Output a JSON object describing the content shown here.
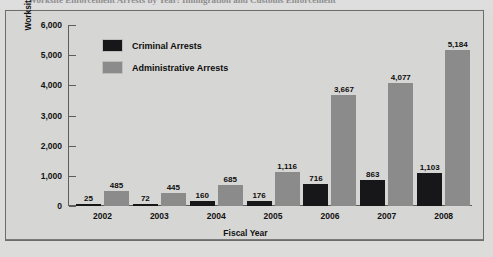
{
  "page": {
    "title_partial": "Worksite Enforcement Arrests by Year: Immigration and Customs Enforcement"
  },
  "legend": {
    "position": "inside-top-left",
    "items": [
      {
        "label": "Criminal Arrests",
        "color": "#17171a"
      },
      {
        "label": "Administrative Arrests",
        "color": "#8b8b8b"
      }
    ]
  },
  "axes": {
    "y_title": "Worksite Enforcement Arrests",
    "x_title": "Fiscal Year",
    "y_ticks": [
      "0",
      "1,000",
      "2,000",
      "3,000",
      "4,000",
      "5,000",
      "6,000"
    ]
  },
  "chart_data": {
    "type": "bar",
    "title": "Worksite Enforcement Arrests by Year: Immigration and Customs Enforcement",
    "xlabel": "Fiscal Year",
    "ylabel": "Worksite Enforcement Arrests",
    "ylim": [
      0,
      6000
    ],
    "ytick_step": 1000,
    "grid": false,
    "legend_position": "inside-top-left",
    "categories": [
      "2002",
      "2003",
      "2004",
      "2005",
      "2006",
      "2007",
      "2008"
    ],
    "series": [
      {
        "name": "Criminal Arrests",
        "color": "#17171a",
        "values": [
          25,
          72,
          160,
          176,
          716,
          863,
          1103
        ],
        "labels": [
          "25",
          "72",
          "160",
          "176",
          "716",
          "863",
          "1,103"
        ]
      },
      {
        "name": "Administrative Arrests",
        "color": "#8b8b8b",
        "values": [
          485,
          445,
          685,
          1116,
          3667,
          4077,
          5184
        ],
        "labels": [
          "485",
          "445",
          "685",
          "1,116",
          "3,667",
          "4,077",
          "5,184"
        ]
      }
    ]
  }
}
